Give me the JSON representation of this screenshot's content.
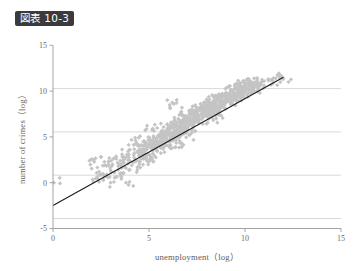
{
  "figure": {
    "badge_label": "図表 10-3",
    "badge_bg": "#3b3b3b",
    "badge_fg": "#ffffff"
  },
  "colors": {
    "marker": "#c4c4c4",
    "fit_line": "#1c1c1c",
    "gridline": "#cfcfcf",
    "axis": "#9a9a9a",
    "text": "#5c5c5c"
  },
  "chart_data": {
    "type": "scatter",
    "title": "図表 10-3",
    "xlabel": "unemployment（log）",
    "ylabel": "number of crimes（log）",
    "xlim": [
      0,
      15
    ],
    "ylim": [
      -5,
      15
    ],
    "xticks": [
      0,
      5,
      10,
      15
    ],
    "xtick_labels": [
      "0",
      "5",
      "10",
      "15"
    ],
    "yticks": [
      -5,
      0,
      5,
      10,
      15
    ],
    "ytick_labels": [
      "-5",
      "0",
      "5",
      "10",
      "15"
    ],
    "grid": "horizontal",
    "legend": "none",
    "annotations": [],
    "series": [
      {
        "name": "municipalities",
        "type": "scatter",
        "marker": "diamond",
        "marker_color": "#c4c4c4",
        "marker_size": 2.1,
        "n_points": 980,
        "x_range": [
          0.0,
          12.0
        ],
        "y_range": [
          -0.1,
          11.6
        ],
        "correlation": 0.95,
        "points": [
          [
            0.05,
            0.0
          ],
          [
            2.1,
            0.1
          ],
          [
            2.3,
            0.6
          ],
          [
            2.4,
            1.2
          ],
          [
            2.6,
            0.4
          ],
          [
            2.7,
            1.9
          ],
          [
            2.8,
            0.9
          ],
          [
            2.9,
            2.3
          ],
          [
            3.0,
            1.4
          ],
          [
            3.0,
            0.0
          ],
          [
            3.1,
            2.0
          ],
          [
            3.2,
            1.1
          ],
          [
            3.3,
            2.6
          ],
          [
            3.4,
            1.8
          ],
          [
            3.5,
            2.4
          ],
          [
            3.5,
            1.0
          ],
          [
            3.6,
            3.1
          ],
          [
            3.7,
            2.2
          ],
          [
            3.8,
            1.6
          ],
          [
            3.8,
            0.0
          ],
          [
            3.9,
            2.9
          ],
          [
            4.0,
            2.4
          ],
          [
            4.0,
            3.6
          ],
          [
            4.1,
            1.9
          ],
          [
            4.2,
            3.0
          ],
          [
            4.3,
            2.5
          ],
          [
            4.4,
            3.4
          ],
          [
            4.4,
            1.7
          ],
          [
            4.5,
            4.0
          ],
          [
            4.6,
            3.1
          ],
          [
            4.7,
            2.6
          ],
          [
            4.7,
            4.5
          ],
          [
            4.8,
            3.6
          ],
          [
            4.9,
            3.0
          ],
          [
            5.0,
            4.2
          ],
          [
            5.0,
            2.3
          ],
          [
            5.1,
            3.8
          ],
          [
            5.2,
            4.6
          ],
          [
            5.2,
            3.2
          ],
          [
            5.3,
            4.1
          ],
          [
            5.4,
            4.9
          ],
          [
            5.4,
            3.6
          ],
          [
            5.5,
            4.4
          ],
          [
            5.6,
            5.1
          ],
          [
            5.6,
            3.9
          ],
          [
            5.7,
            4.7
          ],
          [
            5.8,
            5.4
          ],
          [
            5.8,
            4.2
          ],
          [
            5.9,
            5.0
          ],
          [
            6.0,
            5.7
          ],
          [
            6.0,
            4.5
          ],
          [
            6.1,
            5.3
          ],
          [
            6.2,
            6.0
          ],
          [
            6.2,
            4.8
          ],
          [
            6.3,
            5.6
          ],
          [
            6.4,
            6.3
          ],
          [
            6.4,
            5.1
          ],
          [
            6.5,
            5.9
          ],
          [
            6.6,
            6.6
          ],
          [
            6.6,
            5.4
          ],
          [
            6.7,
            6.2
          ],
          [
            6.8,
            6.9
          ],
          [
            6.8,
            5.7
          ],
          [
            6.9,
            6.5
          ],
          [
            7.0,
            7.2
          ],
          [
            7.0,
            6.0
          ],
          [
            7.1,
            6.8
          ],
          [
            7.2,
            7.4
          ],
          [
            7.2,
            6.3
          ],
          [
            7.3,
            7.0
          ],
          [
            7.4,
            7.7
          ],
          [
            7.4,
            6.6
          ],
          [
            7.5,
            7.3
          ],
          [
            7.6,
            8.0
          ],
          [
            7.6,
            6.9
          ],
          [
            7.7,
            7.5
          ],
          [
            7.8,
            8.2
          ],
          [
            7.8,
            7.1
          ],
          [
            7.9,
            7.8
          ],
          [
            8.0,
            8.4
          ],
          [
            8.0,
            7.4
          ],
          [
            8.1,
            8.1
          ],
          [
            8.2,
            8.7
          ],
          [
            8.2,
            7.6
          ],
          [
            8.3,
            8.3
          ],
          [
            8.4,
            8.9
          ],
          [
            8.4,
            7.9
          ],
          [
            8.5,
            8.6
          ],
          [
            8.6,
            9.1
          ],
          [
            8.6,
            8.2
          ],
          [
            8.7,
            8.8
          ],
          [
            8.8,
            9.4
          ],
          [
            8.8,
            8.4
          ],
          [
            8.9,
            9.0
          ],
          [
            9.0,
            9.6
          ],
          [
            9.0,
            8.7
          ],
          [
            9.1,
            9.3
          ],
          [
            9.2,
            9.8
          ],
          [
            9.2,
            8.9
          ],
          [
            9.3,
            9.5
          ],
          [
            9.4,
            10.0
          ],
          [
            9.4,
            9.2
          ],
          [
            9.5,
            9.7
          ],
          [
            9.6,
            10.2
          ],
          [
            9.6,
            9.4
          ],
          [
            9.7,
            9.9
          ],
          [
            9.8,
            10.4
          ],
          [
            9.8,
            9.6
          ],
          [
            9.9,
            10.1
          ],
          [
            10.0,
            10.6
          ],
          [
            10.0,
            9.9
          ],
          [
            10.1,
            10.3
          ],
          [
            10.2,
            10.8
          ],
          [
            10.2,
            10.1
          ],
          [
            10.3,
            10.5
          ],
          [
            10.4,
            10.9
          ],
          [
            10.4,
            10.3
          ],
          [
            10.5,
            10.7
          ],
          [
            10.6,
            11.0
          ],
          [
            10.6,
            10.5
          ],
          [
            10.8,
            10.9
          ],
          [
            11.0,
            11.1
          ],
          [
            11.2,
            11.3
          ],
          [
            11.4,
            11.2
          ],
          [
            11.6,
            11.4
          ],
          [
            11.8,
            11.5
          ],
          [
            12.0,
            11.4
          ],
          [
            6.3,
            8.6
          ],
          [
            5.2,
            5.9
          ],
          [
            4.3,
            4.6
          ],
          [
            7.1,
            5.2
          ],
          [
            8.5,
            7.0
          ],
          [
            1.9,
            2.4
          ],
          [
            2.5,
            2.8
          ],
          [
            3.3,
            0.6
          ],
          [
            6.7,
            4.3
          ]
        ]
      },
      {
        "name": "regression line",
        "type": "line",
        "color": "#1c1c1c",
        "x_from": 0.0,
        "y_from": -2.5,
        "x_to": 12.0,
        "y_to": 11.5,
        "slope": 1.167,
        "intercept": -2.5
      }
    ]
  }
}
